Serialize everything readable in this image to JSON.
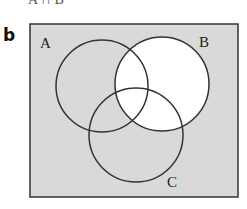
{
  "figure": {
    "top_fragment": "A ∩ B",
    "part_label": "b",
    "universe": {
      "x": 30,
      "y": 24,
      "width": 208,
      "height": 173,
      "fill": "#d9d9d9",
      "stroke": "#333333"
    },
    "sets": [
      {
        "name": "A",
        "cx": 102,
        "cy": 86,
        "r": 46,
        "label_x": 40,
        "label_y": 48,
        "shaded": true
      },
      {
        "name": "B",
        "cx": 162,
        "cy": 84,
        "r": 47,
        "label_x": 199,
        "label_y": 47,
        "shaded": false
      },
      {
        "name": "C",
        "cx": 136,
        "cy": 135,
        "r": 47,
        "label_x": 167,
        "label_y": 187,
        "shaded": true
      }
    ],
    "shaded_region": "U ∖ B",
    "unshaded_fill": "#ffffff",
    "line_color": "#333333"
  }
}
